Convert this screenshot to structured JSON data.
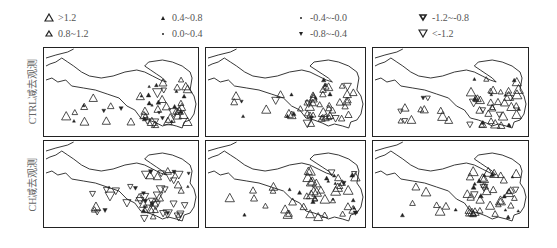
{
  "chart_data": {
    "type": "scatter",
    "title": "",
    "legend": [
      {
        "label": ">1.2",
        "marker": "triangle-up-large"
      },
      {
        "label": "0.8~1.2",
        "marker": "triangle-up-medium"
      },
      {
        "label": "0.4~0.8",
        "marker": "triangle-up-small"
      },
      {
        "label": "0.0~0.4",
        "marker": "dot-tiny"
      },
      {
        "label": "-0.4~-0.0",
        "marker": "dot-tiny"
      },
      {
        "label": "-0.8~-0.4",
        "marker": "triangle-down-small"
      },
      {
        "label": "-1.2~-0.8",
        "marker": "triangle-down-medium"
      },
      {
        "label": "<-1.2",
        "marker": "triangle-down-large"
      }
    ],
    "rows": [
      {
        "ylabel": "CTRL减去观测",
        "panels": 3
      },
      {
        "ylabel": "CH减去观测",
        "panels": 3
      }
    ],
    "legend_position": "top",
    "grid": false
  },
  "legend": {
    "items": [
      {
        "label": ">1.2"
      },
      {
        "label": "0.8~1.2"
      },
      {
        "label": "0.4~0.8"
      },
      {
        "label": "0.0~0.4"
      },
      {
        "label": "-0.4~-0.0"
      },
      {
        "label": "-0.8~-0.4"
      },
      {
        "label": "-1.2~-0.8"
      },
      {
        "label": "<-1.2"
      }
    ]
  },
  "rows": [
    {
      "ylabel": "CTRL减去观测"
    },
    {
      "ylabel": "CH减去观测"
    }
  ]
}
